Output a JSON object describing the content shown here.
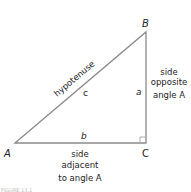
{
  "diagram": {
    "vertices": {
      "A": {
        "label": "A"
      },
      "B": {
        "label": "B"
      },
      "C": {
        "label": "C"
      }
    },
    "sides": {
      "c": {
        "label": "c",
        "name": "hypotenuse"
      },
      "a": {
        "label": "a",
        "description_lines": [
          "side",
          "opposite",
          "angle A"
        ]
      },
      "b": {
        "label": "b",
        "description_lines": [
          "side",
          "adjacent",
          "to angle A"
        ]
      }
    },
    "right_angle_at": "C",
    "caption": "FIGURE 13.1",
    "colors": {
      "line": "#888888",
      "text": "#222222"
    }
  }
}
